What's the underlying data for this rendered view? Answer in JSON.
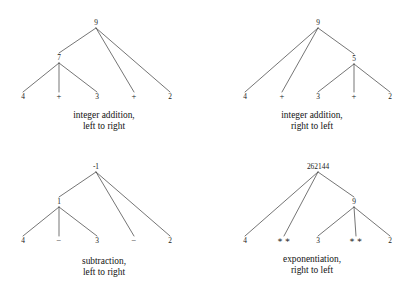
{
  "figure": {
    "panel_width": 208,
    "panel_height": 146,
    "edge_color": "#3a3a3a",
    "text_color": "#1a1a1a"
  },
  "panels": [
    {
      "id": "integer-addition-left-to-right",
      "expression_tokens": [
        "4",
        "+",
        "3",
        "+",
        "2"
      ],
      "result": "9",
      "caption_line1": "integer addition,",
      "caption_line2": "left to right",
      "caption_x": 104,
      "caption_y": 110,
      "nodes": [
        {
          "id": "root",
          "label": "9",
          "kind": "value",
          "x": 96,
          "y": 23
        },
        {
          "id": "inner",
          "label": "7",
          "kind": "value",
          "x": 59,
          "y": 58
        },
        {
          "id": "leaf1",
          "label": "4",
          "kind": "value",
          "x": 23,
          "y": 97
        },
        {
          "id": "leaf2",
          "label": "+",
          "kind": "op",
          "x": 59,
          "y": 97
        },
        {
          "id": "leaf3",
          "label": "3",
          "kind": "value",
          "x": 97,
          "y": 97
        },
        {
          "id": "leaf4",
          "label": "+",
          "kind": "op",
          "x": 134,
          "y": 97
        },
        {
          "id": "leaf5",
          "label": "2",
          "kind": "value",
          "x": 170,
          "y": 97
        }
      ],
      "edges": [
        {
          "from": "root",
          "to": "inner"
        },
        {
          "from": "root",
          "to": "leaf4"
        },
        {
          "from": "root",
          "to": "leaf5"
        },
        {
          "from": "inner",
          "to": "leaf1"
        },
        {
          "from": "inner",
          "to": "leaf2"
        },
        {
          "from": "inner",
          "to": "leaf3"
        }
      ]
    },
    {
      "id": "integer-addition-right-to-left",
      "expression_tokens": [
        "4",
        "+",
        "3",
        "+",
        "2"
      ],
      "result": "9",
      "caption_line1": "integer addition,",
      "caption_line2": "right to left",
      "caption_x": 104,
      "caption_y": 110,
      "nodes": [
        {
          "id": "root",
          "label": "9",
          "kind": "value",
          "x": 110,
          "y": 23
        },
        {
          "id": "inner",
          "label": "5",
          "kind": "value",
          "x": 146,
          "y": 59
        },
        {
          "id": "leaf1",
          "label": "4",
          "kind": "value",
          "x": 37,
          "y": 97
        },
        {
          "id": "leaf2",
          "label": "+",
          "kind": "op",
          "x": 74,
          "y": 97
        },
        {
          "id": "leaf3",
          "label": "3",
          "kind": "value",
          "x": 110,
          "y": 97
        },
        {
          "id": "leaf4",
          "label": "+",
          "kind": "op",
          "x": 146,
          "y": 97
        },
        {
          "id": "leaf5",
          "label": "2",
          "kind": "value",
          "x": 182,
          "y": 97
        }
      ],
      "edges": [
        {
          "from": "root",
          "to": "leaf1"
        },
        {
          "from": "root",
          "to": "leaf2"
        },
        {
          "from": "root",
          "to": "inner"
        },
        {
          "from": "inner",
          "to": "leaf3"
        },
        {
          "from": "inner",
          "to": "leaf4"
        },
        {
          "from": "inner",
          "to": "leaf5"
        }
      ]
    },
    {
      "id": "subtraction-left-to-right",
      "expression_tokens": [
        "4",
        "−",
        "3",
        "−",
        "2"
      ],
      "result": "-1",
      "caption_line1": "subtraction,",
      "caption_line2": "left to right",
      "caption_x": 104,
      "caption_y": 110,
      "nodes": [
        {
          "id": "root",
          "label": "-1",
          "kind": "value",
          "x": 96,
          "y": 21
        },
        {
          "id": "inner",
          "label": "1",
          "kind": "value",
          "x": 59,
          "y": 56
        },
        {
          "id": "leaf1",
          "label": "4",
          "kind": "value",
          "x": 23,
          "y": 95
        },
        {
          "id": "leaf2",
          "label": "−",
          "kind": "op",
          "x": 59,
          "y": 95
        },
        {
          "id": "leaf3",
          "label": "3",
          "kind": "value",
          "x": 97,
          "y": 95
        },
        {
          "id": "leaf4",
          "label": "−",
          "kind": "op",
          "x": 134,
          "y": 95
        },
        {
          "id": "leaf5",
          "label": "2",
          "kind": "value",
          "x": 170,
          "y": 95
        }
      ],
      "edges": [
        {
          "from": "root",
          "to": "inner"
        },
        {
          "from": "root",
          "to": "leaf4"
        },
        {
          "from": "root",
          "to": "leaf5"
        },
        {
          "from": "inner",
          "to": "leaf1"
        },
        {
          "from": "inner",
          "to": "leaf2"
        },
        {
          "from": "inner",
          "to": "leaf3"
        }
      ]
    },
    {
      "id": "exponentiation-right-to-left",
      "expression_tokens": [
        "4",
        "**",
        "3",
        "**",
        "2"
      ],
      "result": "262144",
      "caption_line1": "exponentiation,",
      "caption_line2": "right to left",
      "caption_x": 104,
      "caption_y": 108,
      "nodes": [
        {
          "id": "root",
          "label": "262144",
          "kind": "root-big",
          "x": 110,
          "y": 21
        },
        {
          "id": "inner",
          "label": "9",
          "kind": "value",
          "x": 146,
          "y": 56
        },
        {
          "id": "leaf1",
          "label": "4",
          "kind": "value",
          "x": 37,
          "y": 95
        },
        {
          "id": "leaf2",
          "label": "∗ ∗",
          "kind": "op",
          "x": 76,
          "y": 95
        },
        {
          "id": "leaf3",
          "label": "3",
          "kind": "value",
          "x": 110,
          "y": 95
        },
        {
          "id": "leaf4",
          "label": "∗ ∗",
          "kind": "op",
          "x": 148,
          "y": 95
        },
        {
          "id": "leaf5",
          "label": "2",
          "kind": "value",
          "x": 182,
          "y": 95
        }
      ],
      "edges": [
        {
          "from": "root",
          "to": "leaf1"
        },
        {
          "from": "root",
          "to": "leaf2"
        },
        {
          "from": "root",
          "to": "inner"
        },
        {
          "from": "inner",
          "to": "leaf3"
        },
        {
          "from": "inner",
          "to": "leaf4"
        },
        {
          "from": "inner",
          "to": "leaf5"
        }
      ]
    }
  ]
}
